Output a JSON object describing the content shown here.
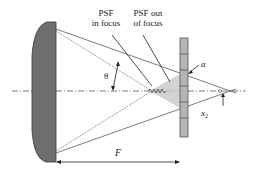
{
  "diagram": {
    "labels": {
      "psf_in_focus_line1": "PSF",
      "psf_in_focus_line2": "in focus",
      "psf_out_focus_line1": "PSF out",
      "psf_out_focus_line2": "of focus",
      "theta": "θ",
      "a": "a",
      "x2": "x",
      "x2_sub": "2",
      "F": "F"
    },
    "colors": {
      "mirror_fill": "#6e6e6e",
      "mirror_stroke": "#333333",
      "detector_fill": "#b5b5b5",
      "line": "#444444",
      "psf_spot": "#c8c8c8"
    }
  }
}
